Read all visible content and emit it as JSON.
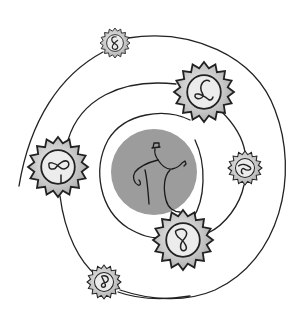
{
  "image": {
    "title": "Spiral of suns around a central figure",
    "alt": "Line drawing of a stick figure wearing a hat, pointing, inside a grey circle, surrounded by a spiral path with seven spiky sun shapes, each containing a looped squiggle"
  },
  "colors": {
    "background": "#ffffff",
    "line": "#222222",
    "center_disc": "#9a9a9a",
    "sun_fill": "#c4c4c4",
    "sun_inner": "#e6e6e6"
  },
  "center": {
    "cx": 154,
    "cy": 172,
    "r": 43
  },
  "suns": [
    {
      "name": "sun-top",
      "cx": 115,
      "cy": 43,
      "r": 15,
      "inner": 9
    },
    {
      "name": "sun-upper-right",
      "cx": 204,
      "cy": 92,
      "r": 30,
      "inner": 17
    },
    {
      "name": "sun-left",
      "cx": 58,
      "cy": 167,
      "r": 30,
      "inner": 17
    },
    {
      "name": "sun-right",
      "cx": 245,
      "cy": 168,
      "r": 17,
      "inner": 10
    },
    {
      "name": "sun-bottom-center",
      "cx": 183,
      "cy": 240,
      "r": 30,
      "inner": 17
    },
    {
      "name": "sun-bottom-left",
      "cx": 104,
      "cy": 282,
      "r": 17,
      "inner": 10
    }
  ]
}
